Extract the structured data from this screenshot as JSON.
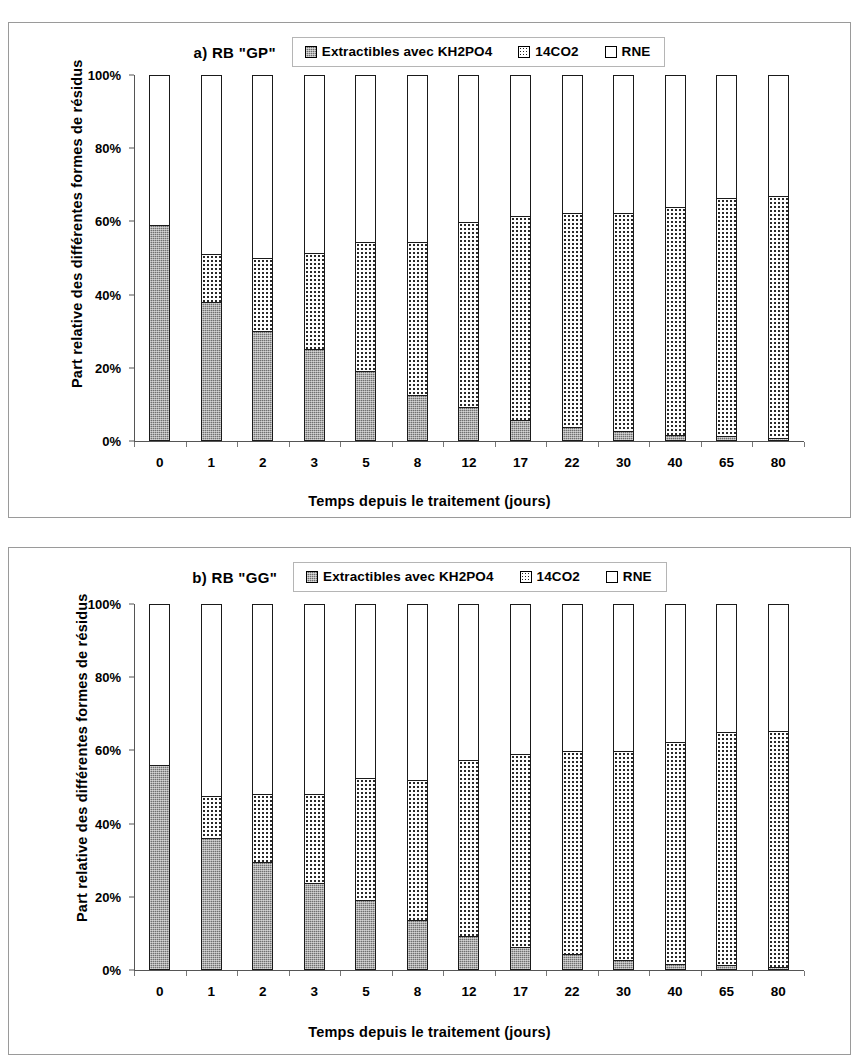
{
  "chart_data": [
    {
      "type": "bar",
      "subtype": "stacked-100-percent",
      "title": "a) RB \"GP\"",
      "xlabel": "Temps depuis le traitement (jours)",
      "ylabel": "Part relative des différentes formes de résidus",
      "categories": [
        "0",
        "1",
        "2",
        "3",
        "5",
        "8",
        "12",
        "17",
        "22",
        "30",
        "40",
        "65",
        "80"
      ],
      "ytick_labels": [
        "0%",
        "20%",
        "40%",
        "60%",
        "80%",
        "100%"
      ],
      "ytick_values": [
        0,
        20,
        40,
        60,
        80,
        100
      ],
      "ylim": [
        0,
        100
      ],
      "grid": false,
      "legend_position": "top",
      "series": [
        {
          "name": "Extractibles avec KH2PO4",
          "pattern": "dark-hatch",
          "values": [
            59,
            38,
            30,
            25,
            19,
            12.5,
            9,
            5.5,
            3.5,
            2.5,
            1.5,
            1,
            0.5
          ]
        },
        {
          "name": "14CO2",
          "pattern": "dotted",
          "values": [
            0,
            13,
            20,
            26.5,
            35.5,
            42,
            51,
            56,
            59,
            60,
            62.5,
            65.5,
            66.5
          ]
        },
        {
          "name": "RNE",
          "pattern": "white",
          "values": [
            41,
            49,
            50,
            48.5,
            45.5,
            45.5,
            40,
            38.5,
            37.5,
            37.5,
            36,
            33.5,
            33
          ]
        }
      ],
      "cumulative_tops": {
        "extractibles": [
          59,
          38,
          30,
          25,
          19,
          12.5,
          9,
          5.5,
          3.5,
          2.5,
          1.5,
          1,
          0.5
        ],
        "co2": [
          59,
          51,
          50,
          51.5,
          54.5,
          54.5,
          60,
          61.5,
          62.5,
          62.5,
          64,
          66.5,
          67
        ]
      }
    },
    {
      "type": "bar",
      "subtype": "stacked-100-percent",
      "title": "b) RB \"GG\"",
      "xlabel": "Temps depuis le traitement (jours)",
      "ylabel": "Part relative des différentes formes de résidus",
      "categories": [
        "0",
        "1",
        "2",
        "3",
        "5",
        "8",
        "12",
        "17",
        "22",
        "30",
        "40",
        "65",
        "80"
      ],
      "ytick_labels": [
        "0%",
        "20%",
        "40%",
        "60%",
        "80%",
        "100%"
      ],
      "ytick_values": [
        0,
        20,
        40,
        60,
        80,
        100
      ],
      "ylim": [
        0,
        100
      ],
      "grid": false,
      "legend_position": "top",
      "series": [
        {
          "name": "Extractibles avec KH2PO4",
          "pattern": "dark-hatch",
          "values": [
            56,
            36,
            29.5,
            23.5,
            19,
            13.5,
            9,
            6,
            4,
            2.5,
            1.5,
            1,
            0.5
          ]
        },
        {
          "name": "14CO2",
          "pattern": "dotted",
          "values": [
            0,
            11.5,
            18.5,
            24.5,
            33.5,
            38.5,
            48.5,
            53,
            56,
            57.5,
            61,
            64,
            65
          ]
        },
        {
          "name": "RNE",
          "pattern": "white",
          "values": [
            44,
            52.5,
            52,
            52,
            47.5,
            48,
            42.5,
            41,
            40,
            40,
            37.5,
            35,
            34.5
          ]
        }
      ],
      "cumulative_tops": {
        "extractibles": [
          56,
          36,
          29.5,
          23.5,
          19,
          13.5,
          9,
          6,
          4,
          2.5,
          1.5,
          1,
          0.5
        ],
        "co2": [
          56,
          47.5,
          48,
          48,
          52.5,
          52,
          57.5,
          59,
          60,
          60,
          62.5,
          65,
          65.5
        ]
      }
    }
  ],
  "panel_a": {
    "title": "a) RB \"GP\"",
    "ylabel": "Part relative des différentes formes de résidus",
    "xlabel": "Temps depuis le traitement (jours)",
    "legend": [
      {
        "label": "Extractibles avec KH2PO4",
        "swatch": "dark-hatch-swatch"
      },
      {
        "label": "14CO2",
        "swatch": "dotted-swatch"
      },
      {
        "label": "RNE",
        "swatch": "white-swatch"
      }
    ],
    "yticks": [
      "100%",
      "80%",
      "60%",
      "40%",
      "20%",
      "0%"
    ],
    "xticks": [
      "0",
      "1",
      "2",
      "3",
      "5",
      "8",
      "12",
      "17",
      "22",
      "30",
      "40",
      "65",
      "80"
    ]
  },
  "panel_b": {
    "title": "b) RB \"GG\"",
    "ylabel": "Part relative des différentes formes de résidus",
    "xlabel": "Temps depuis le traitement (jours)",
    "legend": [
      {
        "label": "Extractibles avec KH2PO4",
        "swatch": "dark-hatch-swatch"
      },
      {
        "label": "14CO2",
        "swatch": "dotted-swatch"
      },
      {
        "label": "RNE",
        "swatch": "white-swatch"
      }
    ],
    "yticks": [
      "100%",
      "80%",
      "60%",
      "40%",
      "20%",
      "0%"
    ],
    "xticks": [
      "0",
      "1",
      "2",
      "3",
      "5",
      "8",
      "12",
      "17",
      "22",
      "30",
      "40",
      "65",
      "80"
    ]
  },
  "colors": {
    "extractibles_fill": "#707070",
    "co2_fill": "#ffffff",
    "rne_fill": "#ffffff",
    "outline": "#1a1a1a",
    "axis": "#555555",
    "panel_border": "#9a9a9a"
  }
}
